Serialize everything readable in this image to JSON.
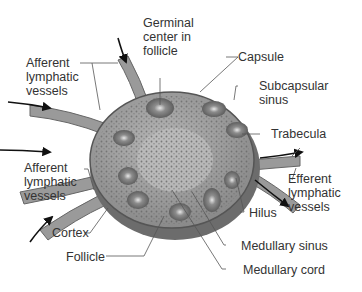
{
  "diagram": {
    "labels": {
      "germinal_center": "Germinal\ncenter in\nfollicle",
      "afferent_top": "Afferent\nlymphatic\nvessels",
      "capsule": "Capsule",
      "subcapsular_sinus": "Subcapsular\nsinus",
      "trabecula": "Trabecula",
      "afferent_bottom": "Afferent\nlymphatic\nvessels",
      "efferent": "Efferent\nlymphatic\nvessels",
      "hilus": "Hilus",
      "cortex": "Cortex",
      "follicle": "Follicle",
      "medullary_sinus": "Medullary sinus",
      "medullary_cord": "Medullary cord"
    }
  }
}
